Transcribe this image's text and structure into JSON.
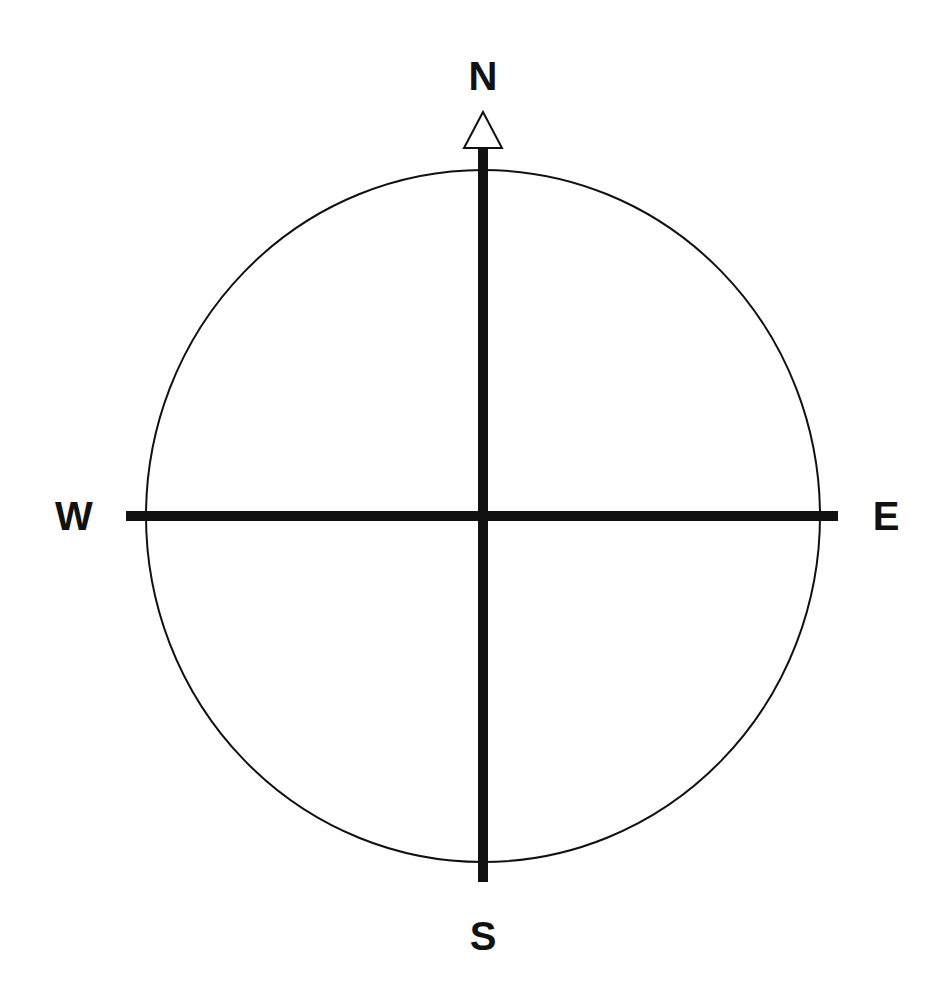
{
  "diagram": {
    "type": "compass-rose",
    "labels": {
      "north": "N",
      "south": "S",
      "east": "E",
      "west": "W"
    },
    "colors": {
      "background": "#ffffff",
      "stroke": "#111111",
      "arrow_fill": "#ffffff"
    }
  }
}
